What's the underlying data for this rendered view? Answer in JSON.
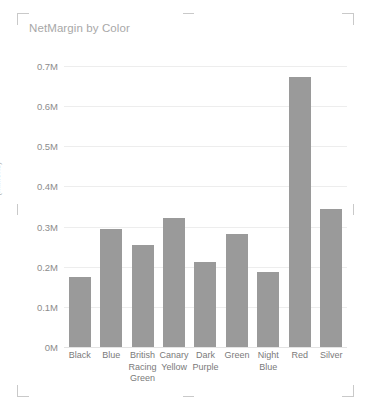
{
  "visual": {
    "title": "NetMargin by Color",
    "handles": {
      "top_left": "resize-handle-top-left",
      "top_right": "resize-handle-top-right",
      "bottom_left": "resize-handle-bottom-left",
      "bottom_right": "resize-handle-bottom-right"
    }
  },
  "chart_data": {
    "type": "bar",
    "title": "NetMargin by Color",
    "xlabel": "",
    "ylabel": "(Millions)",
    "categories": [
      "Black",
      "Blue",
      "British Racing Green",
      "Canary Yellow",
      "Dark Purple",
      "Green",
      "Night Blue",
      "Red",
      "Silver"
    ],
    "values": [
      175000,
      293000,
      253000,
      322000,
      213000,
      282000,
      186000,
      672000,
      343000
    ],
    "ylim": [
      0,
      700000
    ],
    "ytick_labels": [
      "0M",
      "0.1M",
      "0.2M",
      "0.3M",
      "0.4M",
      "0.5M",
      "0.6M",
      "0.7M"
    ],
    "ytick_values": [
      0,
      100000,
      200000,
      300000,
      400000,
      500000,
      600000,
      700000
    ],
    "grid": true,
    "legend": "none",
    "bar_color": "#9a9a9a",
    "title_color": "#a8a8a8",
    "axis_text_color": "#8c8c8c",
    "gridline_color": "#ededed"
  }
}
